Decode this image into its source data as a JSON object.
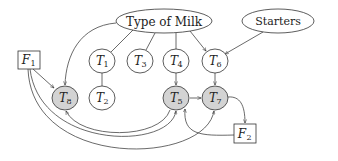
{
  "diagram": {
    "type": "directed-graph",
    "colors": {
      "background": "#ffffff",
      "stroke": "#333333",
      "observed_fill": "#d3d3d3",
      "latent_fill": "#ffffff"
    },
    "nodes": {
      "type_of_milk": {
        "label": "Type of Milk",
        "shape": "ellipse",
        "filled": false
      },
      "starters": {
        "label": "Starters",
        "shape": "ellipse",
        "filled": false
      },
      "f1": {
        "label": "F",
        "sub": "1",
        "shape": "box",
        "filled": false
      },
      "f2": {
        "label": "F",
        "sub": "2",
        "shape": "box",
        "filled": false
      },
      "t1": {
        "label": "T",
        "sub": "1",
        "shape": "circle",
        "filled": false
      },
      "t2": {
        "label": "T",
        "sub": "2",
        "shape": "circle",
        "filled": false
      },
      "t3": {
        "label": "T",
        "sub": "3",
        "shape": "circle",
        "filled": false
      },
      "t4": {
        "label": "T",
        "sub": "4",
        "shape": "circle",
        "filled": false
      },
      "t5": {
        "label": "T",
        "sub": "5",
        "shape": "circle",
        "filled": true
      },
      "t6": {
        "label": "T",
        "sub": "6",
        "shape": "circle",
        "filled": false
      },
      "t7": {
        "label": "T",
        "sub": "7",
        "shape": "circle",
        "filled": true
      },
      "t8": {
        "label": "T",
        "sub": "8",
        "shape": "circle",
        "filled": true
      }
    },
    "edges": [
      {
        "from": "Type of Milk",
        "to": "T8",
        "directed": true
      },
      {
        "from": "Type of Milk",
        "to": "T1",
        "directed": false
      },
      {
        "from": "Type of Milk",
        "to": "T3",
        "directed": false
      },
      {
        "from": "Type of Milk",
        "to": "T4",
        "directed": false
      },
      {
        "from": "Type of Milk",
        "to": "T6",
        "directed": true
      },
      {
        "from": "Starters",
        "to": "T6",
        "directed": true
      },
      {
        "from": "T1",
        "to": "T2",
        "directed": false
      },
      {
        "from": "T4",
        "to": "T5",
        "directed": true
      },
      {
        "from": "T6",
        "to": "T7",
        "directed": true
      },
      {
        "from": "T5",
        "to": "T7",
        "directed": true
      },
      {
        "from": "F1",
        "to": "T8",
        "directed": true
      },
      {
        "from": "F1",
        "to": "T5",
        "directed": true
      },
      {
        "from": "F1",
        "to": "T7",
        "directed": true
      },
      {
        "from": "T5",
        "to": "T8",
        "directed": true
      },
      {
        "from": "T7",
        "to": "F2",
        "directed": true
      },
      {
        "from": "F2",
        "to": "T5",
        "directed": true
      }
    ]
  }
}
